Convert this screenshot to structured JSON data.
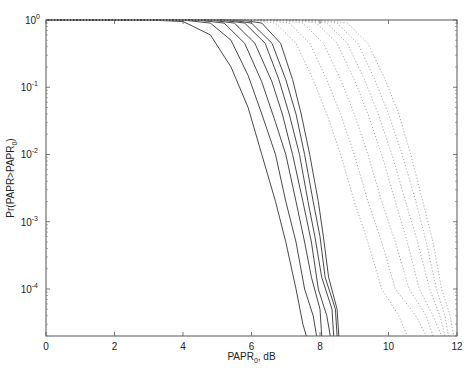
{
  "chart_data": {
    "type": "line",
    "title": "",
    "xlabel": "PAPR",
    "xlabel_sub": "0",
    "xlabel_suffix": ", dB",
    "ylabel": "Pr(PAPR>PAPR",
    "ylabel_sub": "0",
    "ylabel_suffix": ")",
    "xlim": [
      0,
      12
    ],
    "ylim": [
      2e-05,
      1
    ],
    "yscale": "log",
    "grid": false,
    "xticks": [
      0,
      2,
      4,
      6,
      8,
      10,
      12
    ],
    "xtick_labels": [
      "0",
      "2",
      "4",
      "6",
      "8",
      "10",
      "12"
    ],
    "yticks": [
      1,
      0.1,
      0.01,
      0.001,
      0.0001
    ],
    "ytick_labels": [
      {
        "base": "10",
        "exp": "0"
      },
      {
        "base": "10",
        "exp": "-1"
      },
      {
        "base": "10",
        "exp": "-2"
      },
      {
        "base": "10",
        "exp": "-3"
      },
      {
        "base": "10",
        "exp": "-4"
      }
    ],
    "series": [
      {
        "name": "solid-1",
        "style": "solid",
        "points": [
          [
            3.0,
            1
          ],
          [
            4.0,
            0.95
          ],
          [
            4.8,
            0.6
          ],
          [
            5.4,
            0.2
          ],
          [
            5.9,
            0.05
          ],
          [
            6.3,
            0.01
          ],
          [
            6.7,
            0.002
          ],
          [
            7.0,
            0.0005
          ],
          [
            7.3,
            0.0001
          ],
          [
            7.5,
            3e-05
          ],
          [
            7.6,
            2e-05
          ]
        ]
      },
      {
        "name": "solid-2",
        "style": "solid",
        "points": [
          [
            4.0,
            1
          ],
          [
            4.8,
            0.9
          ],
          [
            5.4,
            0.5
          ],
          [
            5.9,
            0.15
          ],
          [
            6.3,
            0.04
          ],
          [
            6.7,
            0.01
          ],
          [
            7.0,
            0.002
          ],
          [
            7.3,
            0.0005
          ],
          [
            7.55,
            0.0001
          ],
          [
            7.8,
            4e-05
          ],
          [
            7.9,
            2e-05
          ]
        ]
      },
      {
        "name": "solid-3",
        "style": "solid",
        "points": [
          [
            4.4,
            1
          ],
          [
            5.2,
            0.9
          ],
          [
            5.8,
            0.45
          ],
          [
            6.3,
            0.12
          ],
          [
            6.7,
            0.03
          ],
          [
            7.0,
            0.01
          ],
          [
            7.3,
            0.002
          ],
          [
            7.55,
            0.0005
          ],
          [
            7.75,
            0.00015
          ],
          [
            8.0,
            5e-05
          ],
          [
            8.05,
            2e-05
          ]
        ]
      },
      {
        "name": "solid-4",
        "style": "solid",
        "points": [
          [
            4.8,
            1
          ],
          [
            5.5,
            0.9
          ],
          [
            6.1,
            0.45
          ],
          [
            6.6,
            0.12
          ],
          [
            6.9,
            0.04
          ],
          [
            7.2,
            0.01
          ],
          [
            7.5,
            0.002
          ],
          [
            7.75,
            0.0005
          ],
          [
            7.95,
            0.0001
          ],
          [
            8.2,
            4e-05
          ],
          [
            8.3,
            2e-05
          ]
        ]
      },
      {
        "name": "solid-5",
        "style": "solid",
        "points": [
          [
            5.1,
            1
          ],
          [
            5.8,
            0.9
          ],
          [
            6.4,
            0.45
          ],
          [
            6.8,
            0.13
          ],
          [
            7.1,
            0.04
          ],
          [
            7.4,
            0.01
          ],
          [
            7.65,
            0.002
          ],
          [
            7.85,
            0.0006
          ],
          [
            8.05,
            0.00015
          ],
          [
            8.35,
            5e-05
          ],
          [
            8.4,
            2e-05
          ]
        ]
      },
      {
        "name": "solid-6",
        "style": "solid",
        "points": [
          [
            5.4,
            1
          ],
          [
            6.0,
            0.9
          ],
          [
            6.6,
            0.45
          ],
          [
            7.0,
            0.13
          ],
          [
            7.3,
            0.04
          ],
          [
            7.55,
            0.01
          ],
          [
            7.8,
            0.002
          ],
          [
            8.0,
            0.0006
          ],
          [
            8.15,
            0.00015
          ],
          [
            8.45,
            5e-05
          ],
          [
            8.5,
            2e-05
          ]
        ]
      },
      {
        "name": "solid-7",
        "style": "solid",
        "points": [
          [
            5.7,
            1
          ],
          [
            6.3,
            0.9
          ],
          [
            6.85,
            0.45
          ],
          [
            7.2,
            0.13
          ],
          [
            7.45,
            0.04
          ],
          [
            7.7,
            0.01
          ],
          [
            7.95,
            0.002
          ],
          [
            8.1,
            0.0006
          ],
          [
            8.25,
            0.00015
          ],
          [
            8.5,
            5e-05
          ],
          [
            8.55,
            2e-05
          ]
        ]
      },
      {
        "name": "dotted-1",
        "style": "dotted",
        "points": [
          [
            6.0,
            1
          ],
          [
            6.7,
            0.9
          ],
          [
            7.3,
            0.45
          ],
          [
            7.8,
            0.13
          ],
          [
            8.2,
            0.04
          ],
          [
            8.6,
            0.01
          ],
          [
            9.0,
            0.002
          ],
          [
            9.4,
            0.0005
          ],
          [
            9.8,
            0.0001
          ],
          [
            10.3,
            4e-05
          ],
          [
            10.55,
            2e-05
          ]
        ]
      },
      {
        "name": "dotted-2",
        "style": "dotted",
        "points": [
          [
            6.4,
            1
          ],
          [
            7.1,
            0.9
          ],
          [
            7.7,
            0.45
          ],
          [
            8.2,
            0.13
          ],
          [
            8.6,
            0.04
          ],
          [
            9.0,
            0.01
          ],
          [
            9.4,
            0.002
          ],
          [
            9.8,
            0.0005
          ],
          [
            10.2,
            0.0001
          ],
          [
            10.8,
            4e-05
          ],
          [
            11.1,
            2e-05
          ]
        ]
      },
      {
        "name": "dotted-3",
        "style": "dotted",
        "points": [
          [
            6.8,
            1
          ],
          [
            7.5,
            0.9
          ],
          [
            8.1,
            0.45
          ],
          [
            8.6,
            0.13
          ],
          [
            9.0,
            0.04
          ],
          [
            9.4,
            0.01
          ],
          [
            9.8,
            0.002
          ],
          [
            10.2,
            0.0005
          ],
          [
            10.6,
            0.0001
          ],
          [
            11.1,
            4e-05
          ],
          [
            11.3,
            2e-05
          ]
        ]
      },
      {
        "name": "dotted-4",
        "style": "dotted",
        "points": [
          [
            7.2,
            1
          ],
          [
            7.9,
            0.9
          ],
          [
            8.5,
            0.45
          ],
          [
            9.0,
            0.13
          ],
          [
            9.4,
            0.04
          ],
          [
            9.8,
            0.01
          ],
          [
            10.2,
            0.002
          ],
          [
            10.55,
            0.0005
          ],
          [
            10.9,
            0.0001
          ],
          [
            11.3,
            4e-05
          ],
          [
            11.55,
            2e-05
          ]
        ]
      },
      {
        "name": "dotted-5",
        "style": "dotted",
        "points": [
          [
            7.5,
            1
          ],
          [
            8.2,
            0.9
          ],
          [
            8.8,
            0.45
          ],
          [
            9.3,
            0.13
          ],
          [
            9.7,
            0.04
          ],
          [
            10.1,
            0.01
          ],
          [
            10.5,
            0.002
          ],
          [
            10.85,
            0.0005
          ],
          [
            11.2,
            0.0001
          ],
          [
            11.5,
            4e-05
          ],
          [
            11.65,
            2e-05
          ]
        ]
      },
      {
        "name": "dotted-6",
        "style": "dotted",
        "points": [
          [
            7.8,
            1
          ],
          [
            8.5,
            0.9
          ],
          [
            9.1,
            0.45
          ],
          [
            9.6,
            0.13
          ],
          [
            10.0,
            0.04
          ],
          [
            10.4,
            0.01
          ],
          [
            10.8,
            0.002
          ],
          [
            11.1,
            0.0005
          ],
          [
            11.4,
            0.0001
          ],
          [
            11.65,
            4e-05
          ],
          [
            11.75,
            2e-05
          ]
        ]
      },
      {
        "name": "dotted-7",
        "style": "dotted",
        "points": [
          [
            8.1,
            1
          ],
          [
            8.8,
            0.9
          ],
          [
            9.4,
            0.45
          ],
          [
            9.9,
            0.13
          ],
          [
            10.3,
            0.04
          ],
          [
            10.65,
            0.01
          ],
          [
            11.0,
            0.002
          ],
          [
            11.3,
            0.0005
          ],
          [
            11.55,
            0.0001
          ],
          [
            11.8,
            4e-05
          ],
          [
            11.9,
            2e-05
          ]
        ]
      }
    ]
  }
}
